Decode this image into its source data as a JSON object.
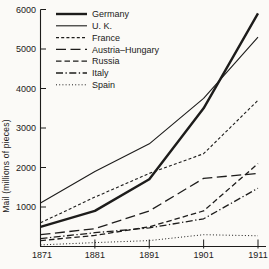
{
  "figure": {
    "background": "#fbfaf7",
    "ink_color": "#1d1c1b"
  },
  "chart_data": {
    "type": "line",
    "title": "",
    "xlabel": "",
    "ylabel": "Mail (millions of pieces)",
    "x": [
      1871,
      1881,
      1891,
      1901,
      1911
    ],
    "x_tick_labels": [
      "1871",
      "1881",
      "1891",
      "1901",
      "1911"
    ],
    "y_ticks": [
      1000,
      2000,
      3000,
      4000,
      5000,
      6000
    ],
    "y_tick_labels": [
      "1000",
      "2000",
      "3000",
      "4000",
      "5000",
      "6000"
    ],
    "ylim": [
      0,
      6000
    ],
    "grid": false,
    "legend_position": "top-left",
    "series": [
      {
        "name": "Germany",
        "line_style": "solid-thick",
        "values": [
          500,
          900,
          1700,
          3500,
          5900
        ]
      },
      {
        "name": "U. K.",
        "line_style": "solid-thin",
        "values": [
          1100,
          1900,
          2600,
          3750,
          5300
        ]
      },
      {
        "name": "France",
        "line_style": "short-dash",
        "values": [
          600,
          1250,
          1850,
          2350,
          3700
        ]
      },
      {
        "name": "Austria–Hungary",
        "line_style": "long-dash",
        "values": [
          300,
          450,
          900,
          1725,
          1850
        ]
      },
      {
        "name": "Russia",
        "line_style": "medium-dash",
        "values": [
          150,
          280,
          500,
          900,
          2100
        ]
      },
      {
        "name": "Italy",
        "line_style": "dash-dot",
        "values": [
          200,
          350,
          470,
          700,
          1475
        ]
      },
      {
        "name": "Spain",
        "line_style": "dotted",
        "values": [
          40,
          100,
          150,
          300,
          270
        ]
      }
    ]
  }
}
